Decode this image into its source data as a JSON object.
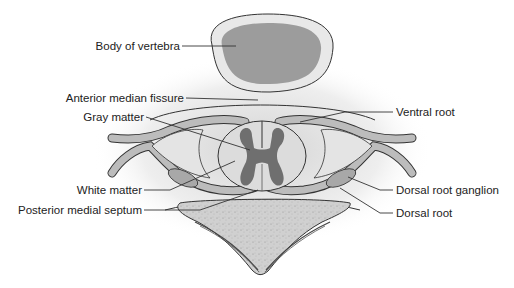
{
  "figure": {
    "labels": {
      "body_of_vertebra": "Body of vertebra",
      "anterior_median_fissure": "Anterior median fissure",
      "gray_matter": "Gray matter",
      "white_matter": "White matter",
      "posterior_medial_septum": "Posterior medial septum",
      "ventral_root": "Ventral root",
      "dorsal_root_ganglion": "Dorsal root ganglion",
      "dorsal_root": "Dorsal root"
    },
    "colors": {
      "background": "#ffffff",
      "outline": "#333333",
      "bone_light": "#e6e6e6",
      "bone_dark": "#9a9a9a",
      "gray_matter": "#6f6f6f",
      "white_matter": "#d9d9d9",
      "nerve": "#b8b8b8",
      "leader_line": "#333333",
      "text": "#222222"
    }
  }
}
